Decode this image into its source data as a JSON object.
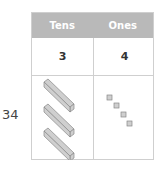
{
  "number_label": "34",
  "table": {
    "headers": [
      "Tens",
      "Ones"
    ],
    "values": [
      "3",
      "4"
    ],
    "header_color": "#b9b9b9"
  },
  "blocks": {
    "tens_rods": 3,
    "ones_cubes": 4
  }
}
